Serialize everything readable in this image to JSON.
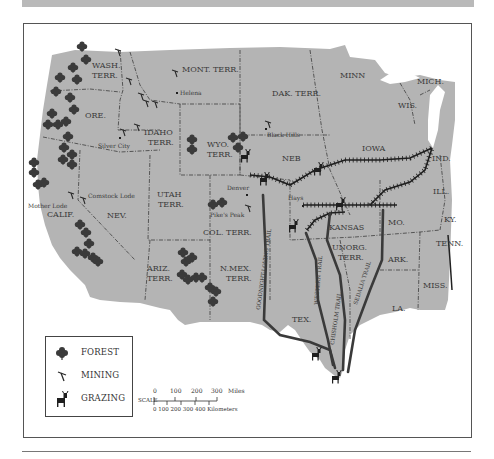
{
  "map": {
    "title": "Land Use in the American West",
    "territories": [
      {
        "id": "wash",
        "label": "WASH.\nTERR."
      },
      {
        "id": "ore",
        "label": "ORE."
      },
      {
        "id": "calif",
        "label": "CALIF."
      },
      {
        "id": "nev",
        "label": "NEV."
      },
      {
        "id": "idaho",
        "label": "IDAHO\nTERR."
      },
      {
        "id": "mont",
        "label": "MONT. TERR."
      },
      {
        "id": "wyo",
        "label": "WYO.\nTERR."
      },
      {
        "id": "utah",
        "label": "UTAH\nTERR."
      },
      {
        "id": "col",
        "label": "COL. TERR."
      },
      {
        "id": "ariz",
        "label": "ARIZ.\nTERR."
      },
      {
        "id": "nmex",
        "label": "N.MEX.\nTERR."
      },
      {
        "id": "dak",
        "label": "DAK. TERR."
      },
      {
        "id": "neb",
        "label": "NEB"
      },
      {
        "id": "kansas",
        "label": "KANSAS"
      },
      {
        "id": "unorg",
        "label": "UNORG.\nTERR."
      },
      {
        "id": "tex",
        "label": "TEX."
      },
      {
        "id": "minn",
        "label": "MINN"
      },
      {
        "id": "iowa",
        "label": "IOWA"
      },
      {
        "id": "mo",
        "label": "MO."
      },
      {
        "id": "ark",
        "label": "ARK."
      },
      {
        "id": "la",
        "label": "LA."
      },
      {
        "id": "wis",
        "label": "WIS."
      },
      {
        "id": "mich",
        "label": "MICH."
      },
      {
        "id": "ill",
        "label": "ILL."
      },
      {
        "id": "ind",
        "label": "IND."
      },
      {
        "id": "ky",
        "label": "KY."
      },
      {
        "id": "tenn",
        "label": "TENN."
      },
      {
        "id": "miss",
        "label": "MISS."
      }
    ],
    "places": {
      "helena": "Helena",
      "silver_city": "Silver City",
      "black_hills": "Black Hills",
      "mother_lode": "Mother Lode",
      "comstock_lode": "Comstock Lode",
      "denver": "Denver",
      "pikes_peak": "Pike's Peak",
      "hays": "Hays"
    },
    "trails": {
      "goodnight": "GOODNIGHT-LOVING TRAIL",
      "western": "WESTERN TRAIL",
      "chisholm": "CHISHOLM TRAIL",
      "sedalia": "SEDALIA TRAIL"
    },
    "colors": {
      "land": "#b4b4b4",
      "border": "#3c3c3c",
      "trail": "#2e2e2e",
      "icon": "#2a2a2a"
    }
  },
  "legend": {
    "items": [
      {
        "icon": "forest-icon",
        "label": "FOREST"
      },
      {
        "icon": "mining-icon",
        "label": "MINING"
      },
      {
        "icon": "grazing-icon",
        "label": "GRAZING"
      }
    ]
  },
  "scale": {
    "label": "SCALE",
    "miles": [
      "0",
      "100",
      "200",
      "300"
    ],
    "miles_unit": "Miles",
    "km": "0  100 200 300 400  Kilometers"
  }
}
